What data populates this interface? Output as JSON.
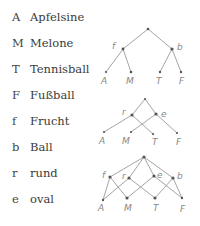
{
  "legend": [
    {
      "symbol": "A",
      "word": "Apfelsine"
    },
    {
      "symbol": "M",
      "word": "Melone"
    },
    {
      "symbol": "T",
      "word": "Tennisball"
    },
    {
      "symbol": "F",
      "word": "Fußball"
    },
    {
      "symbol": "f",
      "word": "Frucht"
    },
    {
      "symbol": "b",
      "word": "Ball"
    },
    {
      "symbol": "r",
      "word": "rund"
    },
    {
      "symbol": "e",
      "word": "oval"
    }
  ],
  "diagrams": [
    {
      "name": "tree-frucht-ball",
      "labels": {
        "f": "f",
        "b": "b",
        "A": "A",
        "M": "M",
        "T": "T",
        "F": "F"
      }
    },
    {
      "name": "tree-rund-oval",
      "labels": {
        "r": "r",
        "e": "e",
        "A": "A",
        "M": "M",
        "T": "T",
        "F": "F"
      }
    },
    {
      "name": "lattice-combined",
      "labels": {
        "f": "f",
        "r": "r",
        "e": "e",
        "b": "b",
        "A": "A",
        "M": "M",
        "T": "T",
        "F": "F"
      }
    }
  ]
}
